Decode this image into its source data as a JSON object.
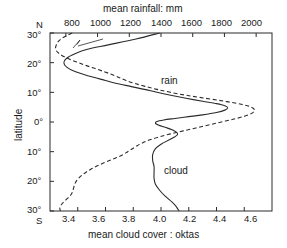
{
  "chart_data": {
    "type": "line",
    "title": "",
    "orientation": "horizontal-value-vertical-latitude",
    "top_axis": {
      "label": "mean rainfall: mm",
      "ticks": [
        800,
        1000,
        1200,
        1400,
        1600,
        1800,
        2000
      ],
      "tick_labels": [
        "800",
        "1000",
        "1200",
        "1400",
        "1600",
        "1800",
        "2000"
      ],
      "range": [
        700,
        2100
      ]
    },
    "bottom_axis": {
      "label": "mean cloud cover : oktas",
      "ticks": [
        3.4,
        3.6,
        3.8,
        4.0,
        4.2,
        4.4,
        4.6
      ],
      "tick_labels": [
        "3.4",
        "3.6",
        "3.8",
        "4.0",
        "4.2",
        "4.4",
        "4.6"
      ],
      "range": [
        3.2,
        4.8
      ]
    },
    "y_axis": {
      "label": "latitude",
      "top_hemisphere": "N",
      "bottom_hemisphere": "S",
      "ticks": [
        30,
        20,
        10,
        0,
        -10,
        -20,
        -30
      ],
      "tick_labels": [
        "30°",
        "20°",
        "10°",
        "0°",
        "10°",
        "20°",
        "30°"
      ],
      "range": [
        -30,
        30
      ]
    },
    "grid": false,
    "legend": "inline-annotations",
    "series": [
      {
        "name": "cloud",
        "style": "solid",
        "units": "oktas",
        "axis": "bottom",
        "annotation": "cloud",
        "points": [
          {
            "lat": 30,
            "value": 3.99
          },
          {
            "lat": 28,
            "value": 3.82
          },
          {
            "lat": 26,
            "value": 3.62
          },
          {
            "lat": 24.5,
            "value": 3.47
          },
          {
            "lat": 23,
            "value": 3.38
          },
          {
            "lat": 21.5,
            "value": 3.32
          },
          {
            "lat": 20,
            "value": 3.3
          },
          {
            "lat": 18.5,
            "value": 3.32
          },
          {
            "lat": 17,
            "value": 3.38
          },
          {
            "lat": 15.5,
            "value": 3.48
          },
          {
            "lat": 14,
            "value": 3.6
          },
          {
            "lat": 13,
            "value": 3.68
          },
          {
            "lat": 12,
            "value": 3.78
          },
          {
            "lat": 11,
            "value": 3.88
          },
          {
            "lat": 10,
            "value": 3.97
          },
          {
            "lat": 9,
            "value": 4.07
          },
          {
            "lat": 8,
            "value": 4.18
          },
          {
            "lat": 7,
            "value": 4.3
          },
          {
            "lat": 6.2,
            "value": 4.4
          },
          {
            "lat": 5.5,
            "value": 4.46
          },
          {
            "lat": 4.8,
            "value": 4.48
          },
          {
            "lat": 4.0,
            "value": 4.46
          },
          {
            "lat": 3.2,
            "value": 4.4
          },
          {
            "lat": 2.4,
            "value": 4.3
          },
          {
            "lat": 1.8,
            "value": 4.2
          },
          {
            "lat": 1.2,
            "value": 4.1
          },
          {
            "lat": 0.7,
            "value": 4.02
          },
          {
            "lat": 0.2,
            "value": 3.97
          },
          {
            "lat": -0.4,
            "value": 3.96
          },
          {
            "lat": -1.0,
            "value": 3.98
          },
          {
            "lat": -1.8,
            "value": 4.03
          },
          {
            "lat": -2.6,
            "value": 4.08
          },
          {
            "lat": -3.4,
            "value": 4.11
          },
          {
            "lat": -4.2,
            "value": 4.12
          },
          {
            "lat": -5.0,
            "value": 4.1
          },
          {
            "lat": -6.0,
            "value": 4.06
          },
          {
            "lat": -7.5,
            "value": 4.0
          },
          {
            "lat": -9.0,
            "value": 3.96
          },
          {
            "lat": -11.0,
            "value": 3.94
          },
          {
            "lat": -13.0,
            "value": 3.94
          },
          {
            "lat": -15.0,
            "value": 3.95
          },
          {
            "lat": -17.0,
            "value": 3.95
          },
          {
            "lat": -19.0,
            "value": 3.95
          },
          {
            "lat": -21.0,
            "value": 3.96
          },
          {
            "lat": -23.0,
            "value": 3.99
          },
          {
            "lat": -25.0,
            "value": 4.03
          },
          {
            "lat": -27.0,
            "value": 4.08
          },
          {
            "lat": -28.5,
            "value": 4.11
          },
          {
            "lat": -30,
            "value": 4.13
          }
        ]
      },
      {
        "name": "rain",
        "style": "dashed",
        "units": "mm",
        "axis": "top",
        "annotation": "rain",
        "points": [
          {
            "lat": 30,
            "value": 840
          },
          {
            "lat": 29,
            "value": 800
          },
          {
            "lat": 28,
            "value": 770
          },
          {
            "lat": 27,
            "value": 750
          },
          {
            "lat": 26,
            "value": 740
          },
          {
            "lat": 25,
            "value": 735
          },
          {
            "lat": 24,
            "value": 740
          },
          {
            "lat": 23,
            "value": 760
          },
          {
            "lat": 22,
            "value": 790
          },
          {
            "lat": 21,
            "value": 830
          },
          {
            "lat": 20,
            "value": 880
          },
          {
            "lat": 19,
            "value": 930
          },
          {
            "lat": 18,
            "value": 985
          },
          {
            "lat": 17,
            "value": 1040
          },
          {
            "lat": 16,
            "value": 1090
          },
          {
            "lat": 15,
            "value": 1135
          },
          {
            "lat": 14,
            "value": 1180
          },
          {
            "lat": 13,
            "value": 1235
          },
          {
            "lat": 12,
            "value": 1300
          },
          {
            "lat": 11,
            "value": 1375
          },
          {
            "lat": 10,
            "value": 1460
          },
          {
            "lat": 9,
            "value": 1560
          },
          {
            "lat": 8,
            "value": 1680
          },
          {
            "lat": 7,
            "value": 1800
          },
          {
            "lat": 6,
            "value": 1905
          },
          {
            "lat": 5,
            "value": 1970
          },
          {
            "lat": 4,
            "value": 1990
          },
          {
            "lat": 3,
            "value": 1975
          },
          {
            "lat": 2,
            "value": 1930
          },
          {
            "lat": 1,
            "value": 1860
          },
          {
            "lat": 0,
            "value": 1780
          },
          {
            "lat": -1,
            "value": 1700
          },
          {
            "lat": -2,
            "value": 1620
          },
          {
            "lat": -3,
            "value": 1540
          },
          {
            "lat": -4,
            "value": 1460
          },
          {
            "lat": -5,
            "value": 1390
          },
          {
            "lat": -6,
            "value": 1330
          },
          {
            "lat": -7,
            "value": 1285
          },
          {
            "lat": -8,
            "value": 1250
          },
          {
            "lat": -9,
            "value": 1220
          },
          {
            "lat": -10,
            "value": 1190
          },
          {
            "lat": -11,
            "value": 1160
          },
          {
            "lat": -12,
            "value": 1120
          },
          {
            "lat": -13,
            "value": 1075
          },
          {
            "lat": -14,
            "value": 1030
          },
          {
            "lat": -15,
            "value": 990
          },
          {
            "lat": -16,
            "value": 955
          },
          {
            "lat": -17,
            "value": 925
          },
          {
            "lat": -18,
            "value": 900
          },
          {
            "lat": -19,
            "value": 880
          },
          {
            "lat": -20,
            "value": 865
          },
          {
            "lat": -21,
            "value": 855
          },
          {
            "lat": -22,
            "value": 850
          },
          {
            "lat": -23,
            "value": 845
          },
          {
            "lat": -24,
            "value": 838
          },
          {
            "lat": -25,
            "value": 825
          },
          {
            "lat": -26,
            "value": 805
          },
          {
            "lat": -27,
            "value": 785
          },
          {
            "lat": -28,
            "value": 770
          },
          {
            "lat": -29,
            "value": 762
          },
          {
            "lat": -30,
            "value": 765
          }
        ]
      }
    ]
  },
  "labels": {
    "top_axis_title": "mean rainfall: mm",
    "bottom_axis_title": "mean cloud cover : oktas",
    "y_axis_title": "latitude",
    "north": "N",
    "south": "S",
    "rain_annotation": "rain",
    "cloud_annotation": "cloud",
    "t800": "800",
    "t1000": "1000",
    "t1200": "1200",
    "t1400": "1400",
    "t1600": "1600",
    "t1800": "1800",
    "t2000": "2000",
    "b34": "3.4",
    "b36": "3.6",
    "b38": "3.8",
    "b40": "4.0",
    "b42": "4.2",
    "b44": "4.4",
    "b46": "4.6",
    "y30n": "30°",
    "y20n": "20°",
    "y10n": "10°",
    "y0": "0°",
    "y10s": "10°",
    "y20s": "20°",
    "y30s": "30°"
  },
  "colors": {
    "axis": "#2b2b2b",
    "curve": "#2b2b2b",
    "background": "#ffffff"
  }
}
